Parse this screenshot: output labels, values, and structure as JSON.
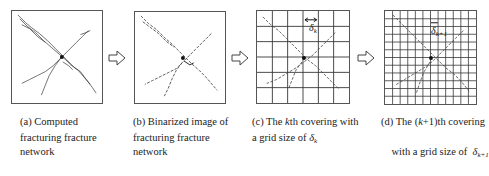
{
  "figure": {
    "panels": [
      {
        "id": "a",
        "type": "computed-network",
        "caption_lines": [
          "(a) Computed",
          "fracturing fracture",
          "network"
        ]
      },
      {
        "id": "b",
        "type": "binarized-image",
        "caption_lines": [
          "(b) Binarized image of",
          "fracturing fracture",
          "network"
        ]
      },
      {
        "id": "c",
        "type": "grid-covering",
        "grid_cells": 6,
        "grid_label_symbol": "δ",
        "grid_label_subscript": "k",
        "caption_line1_prefix": "(c) The ",
        "caption_line1_italic": "k",
        "caption_line1_suffix": "th covering with",
        "caption_line2_prefix": "a grid size of ",
        "caption_line2_symbol": "δ",
        "caption_line2_subscript": "k"
      },
      {
        "id": "d",
        "type": "grid-covering",
        "grid_cells": 12,
        "grid_label_symbol": "δ",
        "grid_label_subscript": "k+1",
        "caption_line1_prefix": "(d) The (",
        "caption_line1_italic": "k",
        "caption_line1_suffix": "+1)th covering",
        "caption_line2_prefix": "with a grid size of  ",
        "caption_line2_symbol": "δ",
        "caption_line2_subscript": "k+1"
      }
    ],
    "arrows": [
      "right-arrow",
      "right-arrow",
      "right-arrow"
    ],
    "colors": {
      "frame": "#555555",
      "grid": "#333333",
      "fracture": "#333333",
      "background": "#ffffff"
    }
  }
}
